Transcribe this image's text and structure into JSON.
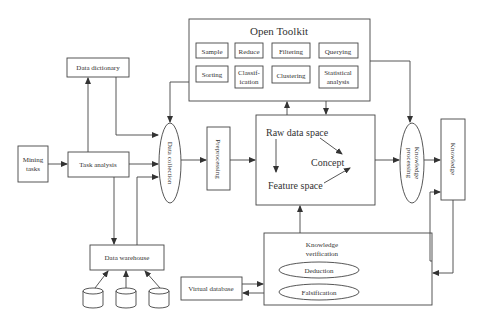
{
  "toolkit": {
    "title": "Open Toolkit",
    "tools": [
      {
        "label1": "Sample",
        "label2": ""
      },
      {
        "label1": "Reduce",
        "label2": ""
      },
      {
        "label1": "Filtering",
        "label2": ""
      },
      {
        "label1": "Querying",
        "label2": ""
      },
      {
        "label1": "Sorting",
        "label2": ""
      },
      {
        "label1": "Classif-",
        "label2": "ication"
      },
      {
        "label1": "Clustering",
        "label2": ""
      },
      {
        "label1": "Statistical",
        "label2": "analysis"
      }
    ]
  },
  "nodes": {
    "data_dictionary": "Data dictionary",
    "mining_tasks_1": "Mining",
    "mining_tasks_2": "tasks",
    "task_analysis": "Task analysis",
    "data_collection": "Data collection",
    "preprocessing": "Preprocessing",
    "raw_data_space": "Raw data space",
    "concept": "Concept",
    "feature_space": "Feature space",
    "knowledge_processing_1": "Knowledge",
    "knowledge_processing_2": "processing",
    "knowledge": "Knowledge",
    "knowledge_verification_1": "Knowledge",
    "knowledge_verification_2": "verification",
    "deduction": "Deduction",
    "falsification": "Falsification",
    "virtual_database": "Virtual database",
    "data_warehouse": "Data warehouse"
  }
}
